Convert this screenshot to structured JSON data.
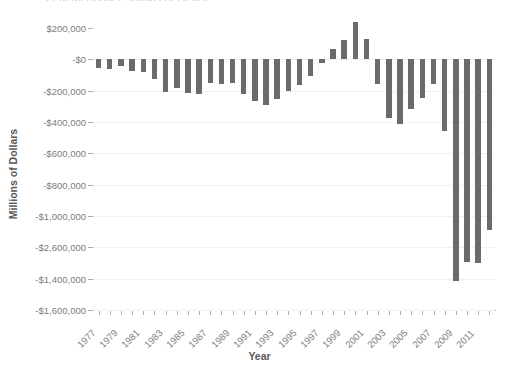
{
  "chart_data": {
    "type": "bar",
    "title": "Federal Budget Surplus or Deficit",
    "xlabel": "Year",
    "ylabel": "Millions of Dollars",
    "grid": true,
    "legend": false,
    "bar_color": "#6b6b6b",
    "ylim": [
      -1600000,
      200000
    ],
    "y_ticks": [
      200000,
      0,
      -200000,
      -400000,
      -600000,
      -800000,
      -1000000,
      -1200000,
      -1400000,
      -1600000
    ],
    "y_tick_labels": [
      "$200,000",
      "-$0",
      "-$200,000",
      "-$400,000",
      "-$600,000",
      "-$800,000",
      "-$1,000,000",
      "-$2,600,000",
      "-$1,400,000",
      "-$1,600,000"
    ],
    "x_tick_labels": [
      "1977",
      "1979",
      "1981",
      "1983",
      "1985",
      "1987",
      "1989",
      "1991",
      "1993",
      "1995",
      "1997",
      "1999",
      "2001",
      "2003",
      "2005",
      "2007",
      "2009",
      "2011"
    ],
    "categories": [
      "1977",
      "1978",
      "1979",
      "1980",
      "1981",
      "1982",
      "1983",
      "1984",
      "1985",
      "1986",
      "1987",
      "1988",
      "1989",
      "1990",
      "1991",
      "1992",
      "1993",
      "1994",
      "1995",
      "1996",
      "1997",
      "1998",
      "1999",
      "2000",
      "2001",
      "2002",
      "2003",
      "2004",
      "2005",
      "2006",
      "2007",
      "2008",
      "2009",
      "2010",
      "2011",
      "2012"
    ],
    "values": [
      -53659,
      -59186,
      -40726,
      -73830,
      -78968,
      -127977,
      -207802,
      -185367,
      -212308,
      -221227,
      -149730,
      -155178,
      -152639,
      -221036,
      -269238,
      -290321,
      -255051,
      -203186,
      -163952,
      -107431,
      -21884,
      69270,
      125610,
      236241,
      128236,
      -157758,
      -377585,
      -412727,
      -318346,
      -248181,
      -160701,
      -458553,
      -1412688,
      -1294373,
      -1299595,
      -1086996
    ]
  }
}
